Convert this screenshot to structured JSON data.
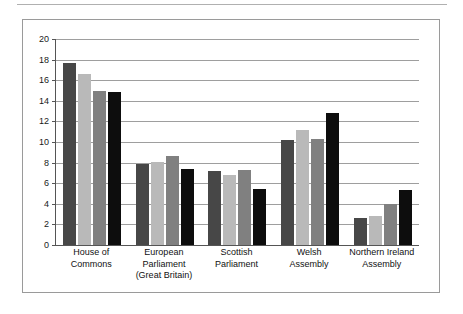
{
  "figure": {
    "top_rule": "horizontal-rule",
    "frame": "chart-border"
  },
  "chart_data": {
    "type": "bar",
    "title": "",
    "subtitle": "",
    "xlabel": "",
    "ylabel": "",
    "grid": true,
    "legend": "none",
    "ylim": [
      0,
      20
    ],
    "yticks": [
      0,
      2,
      4,
      6,
      8,
      10,
      12,
      14,
      16,
      18,
      20
    ],
    "ytick_labels": [
      "0",
      "2",
      "4",
      "6",
      "8",
      "10",
      "12",
      "14",
      "16",
      "18",
      "20"
    ],
    "categories": [
      "House of Commons",
      "European Parliament (Great Britain)",
      "Scottish Parliament",
      "Welsh Assembly",
      "Northern Ireland Assembly"
    ],
    "category_label_lines": [
      [
        "House of",
        "Commons"
      ],
      [
        "European",
        "Parliament",
        "(Great Britain)"
      ],
      [
        "Scottish",
        "Parliament"
      ],
      [
        "Welsh",
        "Assembly"
      ],
      [
        "Northern Ireland",
        "Assembly"
      ]
    ],
    "series": [
      {
        "name": "series-1",
        "color": "#474747",
        "values": [
          17.7,
          7.9,
          7.2,
          10.2,
          2.65
        ]
      },
      {
        "name": "series-2",
        "color": "#b9b9b9",
        "values": [
          16.6,
          8.1,
          6.8,
          11.2,
          2.85
        ]
      },
      {
        "name": "series-3",
        "color": "#808080",
        "values": [
          15.0,
          8.6,
          7.3,
          10.3,
          4.0
        ]
      },
      {
        "name": "series-4",
        "color": "#0d0d0d",
        "values": [
          14.9,
          7.4,
          5.4,
          12.8,
          5.3
        ]
      }
    ]
  },
  "colors": {
    "frame": "#9a9a9a",
    "axis": "#555555",
    "gridline": "#9e9e9e",
    "rule": "#b0b0b0",
    "text": "#111111",
    "background": "#ffffff"
  }
}
